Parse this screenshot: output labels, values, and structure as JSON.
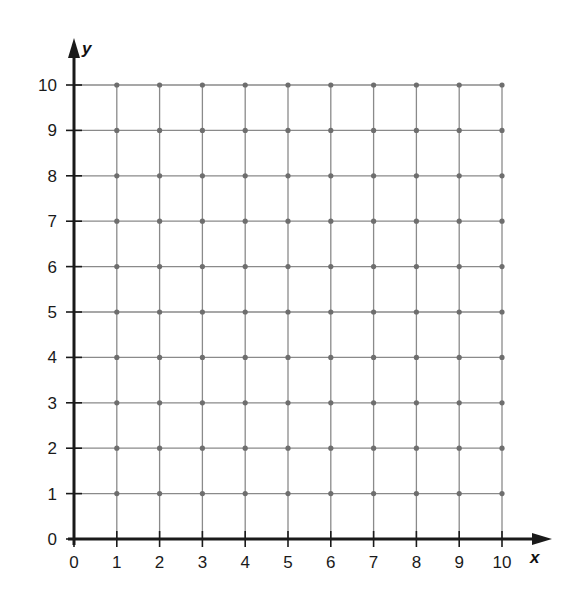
{
  "chart_data": {
    "type": "scatter",
    "title": "",
    "subtitle": "",
    "xlabel": "x",
    "ylabel": "y",
    "xlim": [
      0,
      10
    ],
    "ylim": [
      0,
      10
    ],
    "x_ticks": [
      0,
      1,
      2,
      3,
      4,
      5,
      6,
      7,
      8,
      9,
      10
    ],
    "y_ticks": [
      0,
      1,
      2,
      3,
      4,
      5,
      6,
      7,
      8,
      9,
      10
    ],
    "x_tick_labels": [
      "0",
      "1",
      "2",
      "3",
      "4",
      "5",
      "6",
      "7",
      "8",
      "9",
      "10"
    ],
    "y_tick_labels": [
      "0",
      "1",
      "2",
      "3",
      "4",
      "5",
      "6",
      "7",
      "8",
      "9",
      "10"
    ],
    "grid": true,
    "grid_points": "dots at every integer lattice point (x=1..10, y=1..10)",
    "series": [],
    "legend": null
  },
  "colors": {
    "axis": "#1a1a1a",
    "grid_line": "#8a8a8a",
    "grid_dot": "#6e6e6e",
    "text": "#1a1a1a",
    "background": "#ffffff"
  },
  "layout": {
    "origin_px": [
      74,
      539
    ],
    "x_unit_px": 42.8,
    "y_unit_px": 45.4,
    "x_arrow_tip_px": 552,
    "y_arrow_tip_px": 38
  }
}
